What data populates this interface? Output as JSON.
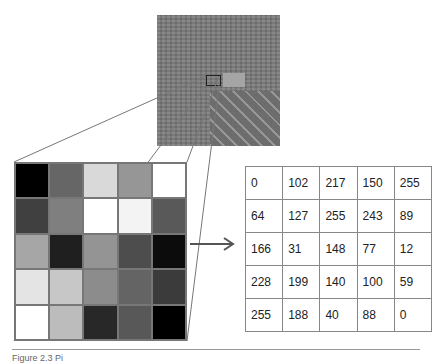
{
  "figure": {
    "aerial_image": {
      "label": "aerial photograph",
      "selection_box": true
    },
    "pixel_grid": {
      "rows": 5,
      "cols": 5,
      "values": [
        [
          0,
          102,
          217,
          150,
          255
        ],
        [
          64,
          127,
          255,
          243,
          89
        ],
        [
          166,
          31,
          148,
          77,
          12
        ],
        [
          228,
          199,
          140,
          100,
          59
        ],
        [
          255,
          188,
          40,
          88,
          0
        ]
      ]
    },
    "table": {
      "rows": [
        [
          "0",
          "102",
          "217",
          "150",
          "255"
        ],
        [
          "64",
          "127",
          "255",
          "243",
          "89"
        ],
        [
          "166",
          "31",
          "148",
          "77",
          "12"
        ],
        [
          "228",
          "199",
          "140",
          "100",
          "59"
        ],
        [
          "255",
          "188",
          "40",
          "88",
          "0"
        ]
      ]
    },
    "arrow": "right-arrow",
    "caption": "Figure 2.3  Pi"
  }
}
